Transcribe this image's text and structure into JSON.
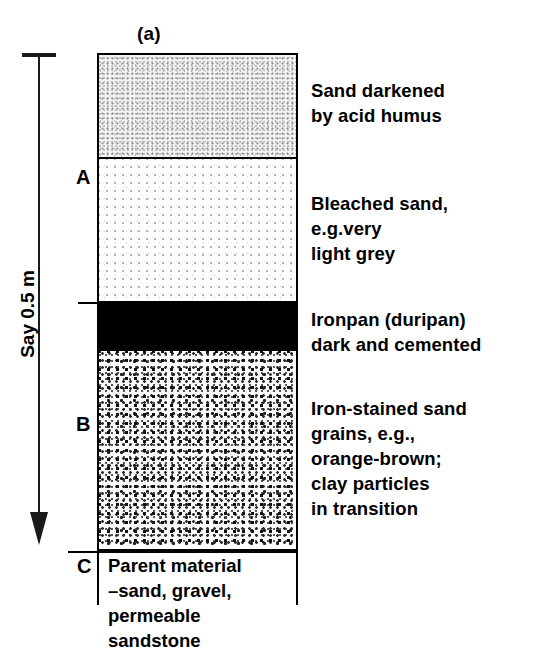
{
  "figure": {
    "label": "(a)",
    "depth_scale_label": "Say 0.5 m"
  },
  "horizons": [
    {
      "letter": "",
      "name": "humus-darkened-sand",
      "texture": "fine dense grey stipple",
      "note_lines": [
        "Sand darkened",
        "by acid humus"
      ]
    },
    {
      "letter": "A",
      "name": "bleached-sand",
      "texture": "sparse light stipple",
      "note_lines": [
        "Bleached sand,",
        "e.g.very",
        "light grey"
      ]
    },
    {
      "letter": "",
      "name": "ironpan",
      "texture": "solid black",
      "note_lines": [
        "Ironpan (duripan)",
        "dark and cemented"
      ]
    },
    {
      "letter": "B",
      "name": "iron-stained-sand",
      "texture": "coarse dark speckle",
      "note_lines": [
        "Iron-stained sand",
        "grains, e.g.,",
        "orange-brown;",
        "clay particles",
        " in transition"
      ]
    },
    {
      "letter": "C",
      "name": "parent-material",
      "texture": "none",
      "note_lines": [
        "Parent material",
        "–sand, gravel,",
        "permeable",
        "sandstone"
      ]
    }
  ],
  "colors": {
    "ink": "#000000",
    "ironpan_fill": "#000000",
    "humus_fill": "#f2f2f2",
    "bleached_fill": "#fdfdfd",
    "b_horizon_fill": "#fafafa"
  }
}
